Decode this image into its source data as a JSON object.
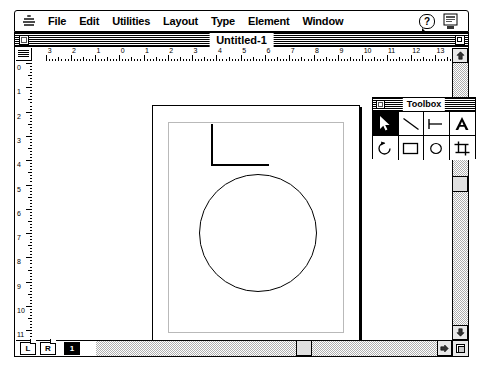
{
  "menubar": {
    "apple_icon": "apple-logo-icon",
    "items": [
      {
        "label": "File"
      },
      {
        "label": "Edit"
      },
      {
        "label": "Utilities"
      },
      {
        "label": "Layout"
      },
      {
        "label": "Type"
      },
      {
        "label": "Element"
      },
      {
        "label": "Window"
      }
    ],
    "help_label": "?",
    "help_icon": "help-balloon-icon",
    "app_icon": "application-switcher-icon"
  },
  "window": {
    "title": "Untitled-1",
    "close_icon": "close-box-icon",
    "zoom_icon": "zoom-box-icon"
  },
  "rulers": {
    "horizontal_labels": [
      "4",
      "3",
      "2",
      "1",
      "0",
      "1",
      "2",
      "3",
      "4",
      "5",
      "6",
      "7",
      "8",
      "9",
      "10",
      "11",
      "12",
      "13"
    ],
    "vertical_labels": [
      "0",
      "1",
      "2",
      "3",
      "4",
      "5",
      "6",
      "7",
      "8",
      "9",
      "10",
      "11"
    ],
    "unit": "inches"
  },
  "toolbox": {
    "title": "Toolbox",
    "close_icon": "close-box-icon",
    "tools": [
      {
        "name": "pointer-tool",
        "icon": "arrow-pointer-icon",
        "selected": true
      },
      {
        "name": "line-tool",
        "icon": "diagonal-line-icon",
        "selected": false
      },
      {
        "name": "constrained-line-tool",
        "icon": "perpendicular-line-icon",
        "selected": false
      },
      {
        "name": "text-tool",
        "icon": "letter-a-icon",
        "selected": false
      },
      {
        "name": "rotate-tool",
        "icon": "rotate-arrow-icon",
        "selected": false
      },
      {
        "name": "rectangle-tool",
        "icon": "rectangle-icon",
        "selected": false
      },
      {
        "name": "ellipse-tool",
        "icon": "ellipse-icon",
        "selected": false
      },
      {
        "name": "crop-tool",
        "icon": "crop-icon",
        "selected": false
      }
    ]
  },
  "pagebar": {
    "master_left": "L",
    "master_right": "R",
    "pages": [
      {
        "label": "1",
        "current": true
      }
    ]
  },
  "scrollbars": {
    "up_icon": "scroll-up-arrow-icon",
    "down_icon": "scroll-down-arrow-icon",
    "left_icon": "scroll-left-arrow-icon",
    "right_icon": "scroll-right-arrow-icon",
    "resize_icon": "resize-grip-icon"
  },
  "artwork": {
    "description": "clock-drawing",
    "shapes": [
      {
        "name": "clock-circle",
        "type": "ellipse"
      },
      {
        "name": "clock-hand-vertical",
        "type": "line"
      },
      {
        "name": "clock-hand-horizontal",
        "type": "line"
      }
    ]
  },
  "colors": {
    "ink": "#000000",
    "paper": "#ffffff",
    "guide": "#b9b9b9",
    "chrome": "#e8e8e8"
  }
}
